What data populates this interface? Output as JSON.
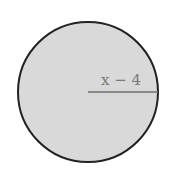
{
  "diagram": {
    "shape": "circle",
    "fill_color": "#d9d9d9",
    "stroke_color": "#222222",
    "radius_line_color": "#6e6e6e",
    "label_color": "#7a7a7a",
    "radius_label": "x − 4"
  }
}
